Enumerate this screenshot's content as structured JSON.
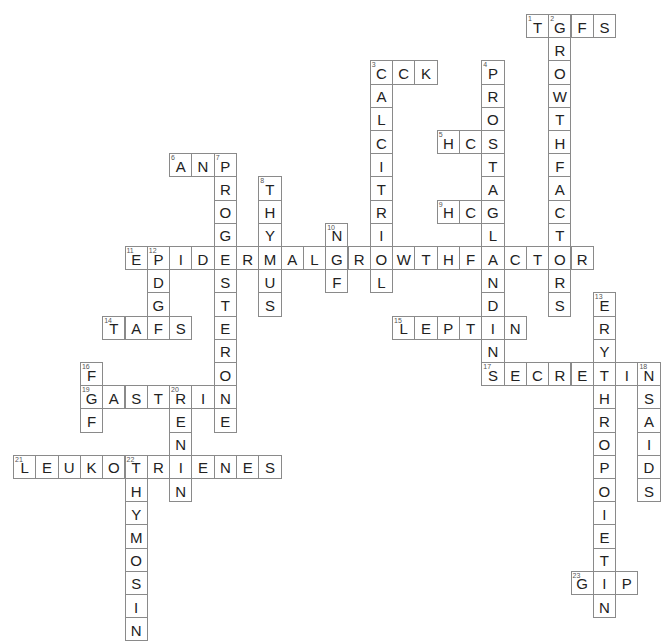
{
  "puzzle": {
    "type": "crossword",
    "grid_origin": {
      "x": 13,
      "y": 14
    },
    "cell_pitch": {
      "w": 22.3,
      "h": 23.2
    },
    "colors": {
      "border": "#8a8a8a",
      "text": "#222222",
      "number": "#555555",
      "background": "#ffffff"
    },
    "words": [
      {
        "number": 1,
        "direction": "across",
        "answer": "TGFS",
        "row": 0,
        "col": 23
      },
      {
        "number": 2,
        "direction": "down",
        "answer": "GROWTHFACTORS",
        "row": 0,
        "col": 24
      },
      {
        "number": 3,
        "direction": "across",
        "answer": "CCK",
        "row": 2,
        "col": 16
      },
      {
        "number": 3,
        "direction": "down",
        "answer": "CALCITRIOL",
        "row": 2,
        "col": 16
      },
      {
        "number": 4,
        "direction": "down",
        "answer": "PROSTAGLANDINS",
        "row": 2,
        "col": 21
      },
      {
        "number": 5,
        "direction": "across",
        "answer": "HCS",
        "row": 5,
        "col": 19
      },
      {
        "number": 6,
        "direction": "across",
        "answer": "ANP",
        "row": 6,
        "col": 7
      },
      {
        "number": 7,
        "direction": "down",
        "answer": "PROGESTERONE",
        "row": 6,
        "col": 9
      },
      {
        "number": 8,
        "direction": "down",
        "answer": "THYMUS",
        "row": 7,
        "col": 11
      },
      {
        "number": 9,
        "direction": "across",
        "answer": "HCG",
        "row": 8,
        "col": 19
      },
      {
        "number": 10,
        "direction": "down",
        "answer": "NGF",
        "row": 9,
        "col": 14
      },
      {
        "number": 11,
        "direction": "across",
        "answer": "EPIDERMALGROWTHFACTOR",
        "row": 10,
        "col": 5
      },
      {
        "number": 12,
        "direction": "down",
        "answer": "PDGF",
        "row": 10,
        "col": 6
      },
      {
        "number": 13,
        "direction": "down",
        "answer": "ERYTHROPOIETIN",
        "row": 12,
        "col": 26
      },
      {
        "number": 14,
        "direction": "across",
        "answer": "TAFS",
        "row": 13,
        "col": 4
      },
      {
        "number": 15,
        "direction": "across",
        "answer": "LEPTIN",
        "row": 13,
        "col": 17
      },
      {
        "number": 16,
        "direction": "down",
        "answer": "FGF",
        "row": 15,
        "col": 3
      },
      {
        "number": 17,
        "direction": "across",
        "answer": "SECRETIN",
        "row": 15,
        "col": 21
      },
      {
        "number": 18,
        "direction": "down",
        "answer": "NSAIDS",
        "row": 15,
        "col": 28
      },
      {
        "number": 19,
        "direction": "across",
        "answer": "GASTRIN",
        "row": 16,
        "col": 3
      },
      {
        "number": 20,
        "direction": "down",
        "answer": "RENIN",
        "row": 16,
        "col": 7
      },
      {
        "number": 21,
        "direction": "across",
        "answer": "LEUKOTRIENES",
        "row": 19,
        "col": 0
      },
      {
        "number": 22,
        "direction": "down",
        "answer": "THYMOSIN",
        "row": 19,
        "col": 5
      },
      {
        "number": 23,
        "direction": "across",
        "answer": "GIP",
        "row": 24,
        "col": 25
      }
    ]
  }
}
